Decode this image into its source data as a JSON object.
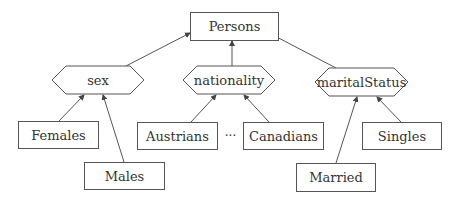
{
  "diagram": {
    "root": {
      "id": "persons",
      "label": "Persons",
      "shape": "rectangle"
    },
    "attributes": [
      {
        "id": "sex",
        "label": "sex",
        "shape": "hexagon",
        "parent": "persons"
      },
      {
        "id": "nationality",
        "label": "nationality",
        "shape": "hexagon",
        "parent": "persons"
      },
      {
        "id": "maritalStatus",
        "label": "maritalStatus",
        "shape": "hexagon",
        "parent": "persons"
      }
    ],
    "classes": [
      {
        "id": "females",
        "label": "Females",
        "shape": "rectangle",
        "parent": "sex"
      },
      {
        "id": "males",
        "label": "Males",
        "shape": "rectangle",
        "parent": "sex"
      },
      {
        "id": "austrians",
        "label": "Austrians",
        "shape": "rectangle",
        "parent": "nationality"
      },
      {
        "id": "canadians",
        "label": "Canadians",
        "shape": "rectangle",
        "parent": "nationality"
      },
      {
        "id": "married",
        "label": "Married",
        "shape": "rectangle",
        "parent": "maritalStatus"
      },
      {
        "id": "singles",
        "label": "Singles",
        "shape": "rectangle",
        "parent": "maritalStatus"
      }
    ],
    "ellipsis": "···",
    "stroke_color": "#555555"
  }
}
